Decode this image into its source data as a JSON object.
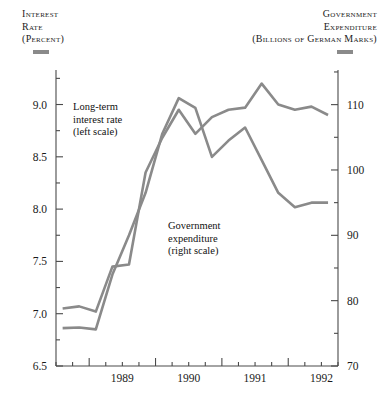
{
  "header": {
    "left": {
      "line1": "Interest",
      "line2": "Rate",
      "line3": "(Percent)"
    },
    "right": {
      "line1": "Government",
      "line2": "Expenditure",
      "line3": "(Billions of German Marks)"
    }
  },
  "annotations": {
    "rate": {
      "line1": "Long-term",
      "line2": "interest rate",
      "line3": "(left scale)"
    },
    "expenditure": {
      "line1": "Government",
      "line2": "expenditure",
      "line3": "(right scale)"
    }
  },
  "colors": {
    "series": "#8a8a8a",
    "axis": "#4a4a4a",
    "text": "#1a1a1a",
    "background": "#ffffff"
  },
  "chart_data": {
    "type": "line",
    "title": "",
    "xlabel": "",
    "ylabel": "Interest Rate (Percent)",
    "y2label": "Government Expenditure (Billions of German Marks)",
    "grid": false,
    "legend": "inline-annotations",
    "xlim": [
      1988.5,
      1992.75
    ],
    "xticks": [
      1989,
      1990,
      1991,
      1992
    ],
    "xtick_labels": [
      "1989",
      "1990",
      "1991",
      "1992"
    ],
    "xminor_step": 0.25,
    "ylim": [
      6.5,
      9.33
    ],
    "yticks": [
      6.5,
      7.0,
      7.5,
      8.0,
      8.5,
      9.0
    ],
    "ytick_labels": [
      "6.5",
      "7.0",
      "7.5",
      "8.0",
      "8.5",
      "9.0"
    ],
    "yminor": [
      6.75,
      7.25,
      7.75,
      8.25,
      8.75,
      9.25
    ],
    "y2lim": [
      70,
      115.3
    ],
    "y2ticks": [
      70,
      80,
      90,
      100,
      110
    ],
    "y2tick_labels": [
      "70",
      "80",
      "90",
      "100",
      "110"
    ],
    "y2minor": [
      75,
      85,
      95,
      105,
      115
    ],
    "series": [
      {
        "name": "Long-term interest rate",
        "axis": "left",
        "x": [
          1988.6,
          1988.85,
          1989.1,
          1989.35,
          1989.6,
          1989.85,
          1990.1,
          1990.35,
          1990.6,
          1990.85,
          1991.1,
          1991.35,
          1991.6,
          1991.85,
          1992.1,
          1992.35,
          1992.6
        ],
        "values": [
          7.05,
          7.07,
          7.02,
          7.45,
          7.47,
          8.35,
          8.68,
          8.95,
          8.72,
          8.88,
          8.95,
          8.97,
          9.2,
          9.0,
          8.95,
          8.98,
          8.9
        ]
      },
      {
        "name": "Government expenditure",
        "axis": "right",
        "x": [
          1988.6,
          1988.85,
          1989.1,
          1989.35,
          1989.6,
          1989.85,
          1990.1,
          1990.35,
          1990.6,
          1990.85,
          1991.1,
          1991.35,
          1991.6,
          1991.85,
          1992.1,
          1992.35,
          1992.6
        ],
        "values": [
          75.8,
          75.9,
          75.6,
          84.0,
          90.0,
          96.5,
          105.5,
          111.0,
          109.5,
          102.0,
          104.5,
          106.5,
          101.5,
          96.5,
          94.3,
          95.0,
          95.0
        ]
      }
    ]
  }
}
